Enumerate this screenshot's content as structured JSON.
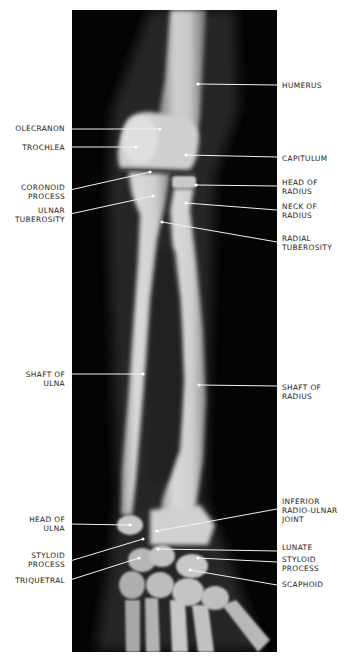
{
  "figure": {
    "type": "radiograph",
    "view": "anteroposterior forearm, elbow to wrist",
    "panel": {
      "x": 72,
      "y": 10,
      "width": 205,
      "height": 642,
      "background": "#050505"
    },
    "colors": {
      "bone": "#d8d8d8",
      "leader_line": "#f2f2f2",
      "label_text": "#1a1a1a",
      "page": "#ffffff"
    }
  },
  "labels": {
    "left": [
      {
        "id": "olecranon",
        "lines": [
          "OLECRANON"
        ],
        "x": 65,
        "y": 124,
        "line": [
          70,
          129,
          160,
          129
        ]
      },
      {
        "id": "trochlea",
        "lines": [
          "TROCHLEA"
        ],
        "x": 65,
        "y": 143,
        "line": [
          70,
          147,
          136,
          147
        ]
      },
      {
        "id": "coronoid-process",
        "lines": [
          "CORONOID",
          "PROCESS"
        ],
        "x": 65,
        "y": 183,
        "line": [
          70,
          190,
          150,
          172
        ]
      },
      {
        "id": "ulnar-tuberosity",
        "lines": [
          "ULNAR",
          "TUBEROSITY"
        ],
        "x": 65,
        "y": 206,
        "line": [
          70,
          214,
          153,
          196
        ]
      },
      {
        "id": "shaft-of-ulna",
        "lines": [
          "SHAFT OF",
          "ULNA"
        ],
        "x": 65,
        "y": 370,
        "line": [
          70,
          374,
          143,
          374
        ]
      },
      {
        "id": "head-of-ulna",
        "lines": [
          "HEAD OF",
          "ULNA"
        ],
        "x": 65,
        "y": 515,
        "line": [
          70,
          524,
          130,
          525
        ]
      },
      {
        "id": "styloid-process-ulna",
        "lines": [
          "STYLOID",
          "PROCESS"
        ],
        "x": 65,
        "y": 551,
        "line": [
          70,
          561,
          143,
          539
        ]
      },
      {
        "id": "triquetral",
        "lines": [
          "TRIQUETRAL"
        ],
        "x": 65,
        "y": 576,
        "line": [
          70,
          580,
          139,
          558
        ]
      }
    ],
    "right": [
      {
        "id": "humerus",
        "lines": [
          "HUMERUS"
        ],
        "x": 282,
        "y": 81,
        "line": [
          198,
          84,
          277,
          85
        ]
      },
      {
        "id": "capitulum",
        "lines": [
          "CAPITULUM"
        ],
        "x": 282,
        "y": 154,
        "line": [
          186,
          155,
          277,
          157
        ]
      },
      {
        "id": "head-of-radius",
        "lines": [
          "HEAD OF",
          "RADIUS"
        ],
        "x": 282,
        "y": 178,
        "line": [
          196,
          185,
          277,
          186
        ]
      },
      {
        "id": "neck-of-radius",
        "lines": [
          "NECK OF",
          "RADIUS"
        ],
        "x": 282,
        "y": 202,
        "line": [
          186,
          203,
          277,
          210
        ]
      },
      {
        "id": "radial-tuberosity",
        "lines": [
          "RADIAL",
          "TUBEROSITY"
        ],
        "x": 282,
        "y": 234,
        "line": [
          162,
          222,
          277,
          242
        ]
      },
      {
        "id": "shaft-of-radius",
        "lines": [
          "SHAFT OF",
          "RADIUS"
        ],
        "x": 282,
        "y": 383,
        "line": [
          199,
          385,
          277,
          386
        ]
      },
      {
        "id": "inferior-radio-ulnar-joint",
        "lines": [
          "INFERIOR",
          "RADIO-ULNAR",
          "JOINT"
        ],
        "x": 282,
        "y": 497,
        "line": [
          157,
          531,
          277,
          509
        ]
      },
      {
        "id": "lunate",
        "lines": [
          "LUNATE"
        ],
        "x": 282,
        "y": 543,
        "line": [
          158,
          549,
          277,
          551
        ]
      },
      {
        "id": "styloid-process-radius",
        "lines": [
          "STYLOID",
          "PROCESS"
        ],
        "x": 282,
        "y": 555,
        "line": [
          198,
          558,
          277,
          562
        ]
      },
      {
        "id": "scaphoid",
        "lines": [
          "SCAPHOID"
        ],
        "x": 282,
        "y": 580,
        "line": [
          190,
          570,
          277,
          585
        ]
      }
    ]
  }
}
